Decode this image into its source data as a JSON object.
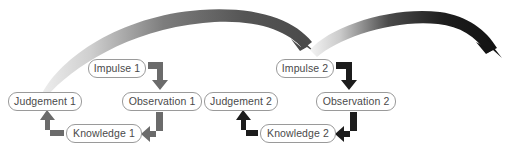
{
  "diagram": {
    "canvas": {
      "width": 510,
      "height": 160,
      "background": "#ffffff"
    },
    "colors": {
      "box_border": "#9a9a9a",
      "box_fill": "#ffffff",
      "text": "#4a4a4a",
      "cycle1_arrow": "#6a6a6a",
      "cycle2_arrow": "#1a1a1a",
      "big_arrow_1_dark": "#4f4f4f",
      "big_arrow_1_light": "#e6e6e6",
      "big_arrow_2_dark": "#161616",
      "big_arrow_2_light": "#f0f0f0"
    },
    "clusters": [
      {
        "id": "cycle-1",
        "arrow_color": "#6a6a6a",
        "nodes": [
          {
            "id": "impulse-1",
            "label": "Impulse 1",
            "x": 88,
            "y": 59,
            "w": 58
          },
          {
            "id": "judgement-1",
            "label": "Judgement 1",
            "x": 8,
            "y": 92,
            "w": 74
          },
          {
            "id": "observation-1",
            "label": "Observation 1",
            "x": 122,
            "y": 92,
            "w": 80
          },
          {
            "id": "knowledge-1",
            "label": "Knowledge 1",
            "x": 66,
            "y": 124,
            "w": 76
          }
        ],
        "connectors": [
          {
            "id": "impulse-1-to-observation-1",
            "from": "impulse-1",
            "to": "observation-1",
            "shape": "right-then-down"
          },
          {
            "id": "observation-1-to-knowledge-1",
            "from": "observation-1",
            "to": "knowledge-1",
            "shape": "down-then-left"
          },
          {
            "id": "knowledge-1-to-judgement-1",
            "from": "knowledge-1",
            "to": "judgement-1",
            "shape": "left-then-up"
          }
        ]
      },
      {
        "id": "cycle-2",
        "arrow_color": "#1a1a1a",
        "nodes": [
          {
            "id": "impulse-2",
            "label": "Impulse 2",
            "x": 276,
            "y": 59,
            "w": 58
          },
          {
            "id": "judgement-2",
            "label": "Judgement 2",
            "x": 204,
            "y": 92,
            "w": 74
          },
          {
            "id": "observation-2",
            "label": "Observation 2",
            "x": 316,
            "y": 92,
            "w": 80
          },
          {
            "id": "knowledge-2",
            "label": "Knowledge 2",
            "x": 260,
            "y": 124,
            "w": 76
          }
        ],
        "connectors": [
          {
            "id": "impulse-2-to-observation-2",
            "from": "impulse-2",
            "to": "observation-2",
            "shape": "right-then-down"
          },
          {
            "id": "observation-2-to-knowledge-2",
            "from": "observation-2",
            "to": "knowledge-2",
            "shape": "down-then-left"
          },
          {
            "id": "knowledge-2-to-judgement-2",
            "from": "knowledge-2",
            "to": "judgement-2",
            "shape": "left-then-up"
          }
        ]
      }
    ],
    "transitions": [
      {
        "id": "cycle-1-to-cycle-2-arc",
        "from": "judgement-1",
        "to": "impulse-2",
        "style": "tapered-curved-arrow",
        "start_weight": "thin",
        "end_weight": "thick",
        "gradient_from": "#e6e6e6",
        "gradient_to": "#4f4f4f"
      },
      {
        "id": "cycle-2-to-next-arc",
        "from": "impulse-2",
        "to": "off-canvas-right",
        "style": "tapered-curved-arrow",
        "start_weight": "thin",
        "end_weight": "thick",
        "gradient_from": "#f0f0f0",
        "gradient_to": "#161616"
      }
    ]
  }
}
